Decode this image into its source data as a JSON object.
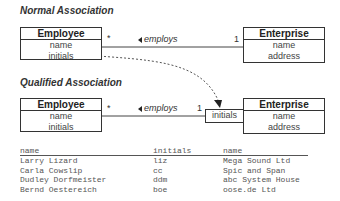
{
  "normal": {
    "title": "Normal Association",
    "employee": {
      "name": "Employee",
      "attrs": [
        "name",
        "initials"
      ]
    },
    "enterprise": {
      "name": "Enterprise",
      "attrs": [
        "name",
        "address"
      ]
    },
    "association": {
      "label": "employs",
      "mult_left": "*",
      "mult_right": "1"
    }
  },
  "qualified": {
    "title": "Qualified Association",
    "employee": {
      "name": "Employee",
      "attrs": [
        "name",
        "initials"
      ]
    },
    "enterprise": {
      "name": "Enterprise",
      "attrs": [
        "name",
        "address"
      ]
    },
    "qualifier": "initials",
    "association": {
      "label": "employs",
      "mult_left": "*",
      "mult_right": "1"
    }
  },
  "table": {
    "headers": [
      "name",
      "initials",
      "name"
    ],
    "rows": [
      [
        "Larry Lizard",
        "liz",
        "Mega Sound Ltd"
      ],
      [
        "Carla Cowslip",
        "cc",
        "Spic and Span"
      ],
      [
        "Dudley Dorfmeister",
        "ddm",
        "abc System House"
      ],
      [
        "Bernd Oestereich",
        "boe",
        "oose.de Ltd"
      ]
    ]
  }
}
